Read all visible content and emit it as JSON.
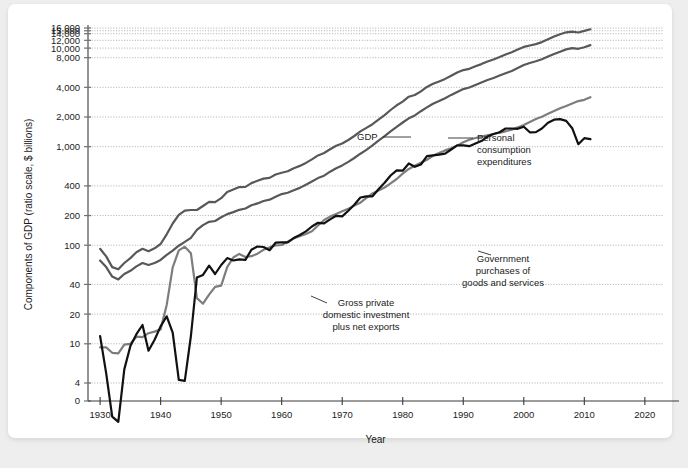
{
  "card": {
    "watermark": ""
  },
  "chart_data": {
    "type": "line",
    "title": "",
    "xlabel": "Year",
    "ylabel": "Components of GDP (ratio scale, $ billions)",
    "scale": "log",
    "grid": true,
    "legend_position": "inline-annotations",
    "xlim": [
      1928,
      2023
    ],
    "ylim": [
      3.2,
      17000
    ],
    "xticks": [
      1930,
      1940,
      1950,
      1960,
      1970,
      1980,
      1990,
      2000,
      2010,
      2020
    ],
    "xtick_labels": [
      "1930",
      "1940",
      "1950",
      "1960",
      "1970",
      "1980",
      "1990",
      "2000",
      "2010",
      "2020"
    ],
    "yticks": [
      0,
      4,
      10,
      20,
      40,
      100,
      200,
      400,
      1000,
      2000,
      4000,
      8000,
      10000,
      12000,
      14000,
      15000,
      16000
    ],
    "ytick_labels": [
      "0",
      "4",
      "10",
      "20",
      "40",
      "100",
      "200",
      "400",
      "1,000",
      "2,000",
      "4,000",
      "8,000",
      "10,000",
      "12,000",
      "14,000",
      "15,000",
      "16,000"
    ],
    "colors": {
      "gdp": "#585858",
      "pce": "#585858",
      "government": "#7d7d7d",
      "investment": "#111111"
    },
    "annotations": [
      {
        "id": "gdp",
        "text": "GDP",
        "x": 357,
        "y": 140,
        "anchor": "start",
        "leader": [
          [
            383,
            137
          ],
          [
            411,
            137
          ]
        ]
      },
      {
        "id": "pce",
        "lines": [
          "Personal",
          "consumption",
          "expenditures"
        ],
        "x": 477,
        "y": 141,
        "anchor": "start",
        "leader": [
          [
            448,
            138
          ],
          [
            473,
            138
          ]
        ]
      },
      {
        "id": "government",
        "lines": [
          "Government",
          "purchases of",
          "goods and services"
        ],
        "x": 503,
        "y": 262,
        "anchor": "middle",
        "leader": [
          [
            478,
            251
          ],
          [
            491,
            255
          ]
        ]
      },
      {
        "id": "investment",
        "lines": [
          "Gross private",
          "domestic investment",
          "plus net exports"
        ],
        "x": 366,
        "y": 306,
        "anchor": "middle",
        "leader": [
          [
            311,
            296
          ],
          [
            327,
            303
          ]
        ]
      }
    ],
    "series": [
      {
        "name": "GDP",
        "key": "gdp",
        "x": [
          1930,
          1931,
          1932,
          1933,
          1934,
          1935,
          1936,
          1937,
          1938,
          1939,
          1940,
          1941,
          1942,
          1943,
          1944,
          1945,
          1946,
          1947,
          1948,
          1949,
          1950,
          1951,
          1952,
          1953,
          1954,
          1955,
          1956,
          1957,
          1958,
          1959,
          1960,
          1961,
          1962,
          1963,
          1964,
          1965,
          1966,
          1967,
          1968,
          1969,
          1970,
          1971,
          1972,
          1973,
          1974,
          1975,
          1976,
          1977,
          1978,
          1979,
          1980,
          1981,
          1982,
          1983,
          1984,
          1985,
          1986,
          1987,
          1988,
          1989,
          1990,
          1991,
          1992,
          1993,
          1994,
          1995,
          1996,
          1997,
          1998,
          1999,
          2000,
          2001,
          2002,
          2003,
          2004,
          2005,
          2006,
          2007,
          2008,
          2009,
          2010,
          2011
        ],
        "values": [
          92,
          77,
          60,
          57,
          66,
          74,
          85,
          92,
          87,
          93,
          103,
          129,
          166,
          203,
          224,
          228,
          228,
          250,
          275,
          273,
          300,
          347,
          368,
          389,
          391,
          427,
          450,
          474,
          482,
          522,
          543,
          563,
          605,
          638,
          685,
          743,
          815,
          862,
          943,
          1020,
          1076,
          1168,
          1282,
          1429,
          1549,
          1689,
          1878,
          2086,
          2357,
          2632,
          2863,
          3211,
          3345,
          3638,
          4041,
          4347,
          4590,
          4870,
          5253,
          5658,
          5980,
          6174,
          6539,
          6879,
          7309,
          7664,
          8100,
          8609,
          9089,
          9661,
          10290,
          10625,
          10980,
          11512,
          12277,
          13095,
          13858,
          14480,
          14720,
          14418,
          14958,
          15534
        ]
      },
      {
        "name": "Personal consumption expenditures",
        "key": "pce",
        "x": [
          1930,
          1931,
          1932,
          1933,
          1934,
          1935,
          1936,
          1937,
          1938,
          1939,
          1940,
          1941,
          1942,
          1943,
          1944,
          1945,
          1946,
          1947,
          1948,
          1949,
          1950,
          1951,
          1952,
          1953,
          1954,
          1955,
          1956,
          1957,
          1958,
          1959,
          1960,
          1961,
          1962,
          1963,
          1964,
          1965,
          1966,
          1967,
          1968,
          1969,
          1970,
          1971,
          1972,
          1973,
          1974,
          1975,
          1976,
          1977,
          1978,
          1979,
          1980,
          1981,
          1982,
          1983,
          1984,
          1985,
          1986,
          1987,
          1988,
          1989,
          1990,
          1991,
          1992,
          1993,
          1994,
          1995,
          1996,
          1997,
          1998,
          1999,
          2000,
          2001,
          2002,
          2003,
          2004,
          2005,
          2006,
          2007,
          2008,
          2009,
          2010,
          2011
        ],
        "values": [
          70,
          60,
          48,
          45,
          51,
          55,
          61,
          66,
          63,
          66,
          71,
          80,
          88,
          99,
          108,
          119,
          143,
          160,
          173,
          176,
          192,
          207,
          217,
          229,
          236,
          254,
          266,
          281,
          290,
          310,
          330,
          341,
          362,
          382,
          411,
          443,
          480,
          507,
          557,
          603,
          646,
          700,
          767,
          848,
          927,
          1030,
          1149,
          1278,
          1428,
          1592,
          1757,
          1941,
          2077,
          2290,
          2503,
          2720,
          2899,
          3100,
          3353,
          3598,
          3839,
          3986,
          4235,
          4477,
          4743,
          4976,
          5257,
          5547,
          5879,
          6282,
          6739,
          7055,
          7351,
          7704,
          8196,
          8694,
          9207,
          9710,
          10001,
          9847,
          10202,
          10729
        ]
      },
      {
        "name": "Government purchases of goods and services",
        "key": "government",
        "x": [
          1930,
          1931,
          1932,
          1933,
          1934,
          1935,
          1936,
          1937,
          1938,
          1939,
          1940,
          1941,
          1942,
          1943,
          1944,
          1945,
          1946,
          1947,
          1948,
          1949,
          1950,
          1951,
          1952,
          1953,
          1954,
          1955,
          1956,
          1957,
          1958,
          1959,
          1960,
          1961,
          1962,
          1963,
          1964,
          1965,
          1966,
          1967,
          1968,
          1969,
          1970,
          1971,
          1972,
          1973,
          1974,
          1975,
          1976,
          1977,
          1978,
          1979,
          1980,
          1981,
          1982,
          1983,
          1984,
          1985,
          1986,
          1987,
          1988,
          1989,
          1990,
          1991,
          1992,
          1993,
          1994,
          1995,
          1996,
          1997,
          1998,
          1999,
          2000,
          2001,
          2002,
          2003,
          2004,
          2005,
          2006,
          2007,
          2008,
          2009,
          2010,
          2011
        ],
        "values": [
          9.2,
          9.2,
          8.1,
          8.0,
          9.8,
          10.0,
          11.8,
          11.7,
          12.8,
          13.3,
          14.0,
          24.8,
          59.6,
          88.6,
          96.5,
          83.0,
          29.1,
          25.5,
          31.5,
          37.8,
          38.8,
          59.8,
          75.1,
          81.6,
          76.0,
          77.3,
          82.0,
          89.9,
          95.0,
          99.8,
          100.6,
          108.4,
          118.2,
          123.8,
          130.0,
          138.4,
          158.6,
          180.2,
          195.1,
          208.0,
          221.4,
          234.3,
          252.1,
          269.9,
          302.6,
          335.0,
          358.0,
          385.0,
          424.0,
          470.0,
          533.0,
          595.0,
          639.0,
          687.0,
          738.0,
          808.0,
          862.0,
          916.0,
          962.0,
          1026.0,
          1110.0,
          1177.0,
          1225.0,
          1261.0,
          1304.0,
          1346.0,
          1388.0,
          1433.0,
          1487.0,
          1569.0,
          1665.0,
          1783.0,
          1903.0,
          2016.0,
          2153.0,
          2298.0,
          2449.0,
          2594.0,
          2740.0,
          2901.0,
          2990.0,
          3180.0
        ]
      },
      {
        "name": "Gross private domestic investment plus net exports",
        "key": "investment",
        "x": [
          1930,
          1931,
          1932,
          1933,
          1934,
          1935,
          1936,
          1937,
          1938,
          1939,
          1940,
          1941,
          1942,
          1943,
          1944,
          1945,
          1946,
          1947,
          1948,
          1949,
          1950,
          1951,
          1952,
          1953,
          1954,
          1955,
          1956,
          1957,
          1958,
          1959,
          1960,
          1961,
          1962,
          1963,
          1964,
          1965,
          1966,
          1967,
          1968,
          1969,
          1970,
          1971,
          1972,
          1973,
          1974,
          1975,
          1976,
          1977,
          1978,
          1979,
          1980,
          1981,
          1982,
          1983,
          1984,
          1985,
          1986,
          1987,
          1988,
          1989,
          1990,
          1991,
          1992,
          1993,
          1994,
          1995,
          1996,
          1997,
          1998,
          1999,
          2000,
          2001,
          2002,
          2003,
          2004,
          2005,
          2006,
          2007,
          2008,
          2009,
          2010,
          2011
        ],
        "values": [
          12.0,
          5.0,
          0.3,
          0.2,
          5.5,
          9.5,
          12.5,
          15.5,
          8.5,
          11.0,
          15.0,
          19.0,
          13.0,
          4.3,
          4.2,
          12.0,
          47.0,
          50.0,
          62.0,
          51.0,
          63.0,
          74.0,
          70.0,
          72.0,
          71.0,
          90.0,
          97.0,
          96.0,
          89.0,
          106.0,
          107.0,
          107.0,
          118.0,
          127.0,
          138.0,
          155.0,
          169.0,
          167.0,
          183.0,
          199.0,
          196.0,
          224.0,
          258.0,
          305.0,
          314.0,
          314.0,
          370.0,
          430.0,
          510.0,
          575.0,
          570.0,
          675.0,
          625.0,
          660.0,
          800.0,
          815.0,
          830.0,
          850.0,
          935.0,
          1030.0,
          1030.0,
          1010.0,
          1075.0,
          1140.0,
          1265.0,
          1345.0,
          1400.0,
          1530.0,
          1530.0,
          1520.0,
          1595.0,
          1400.0,
          1405.0,
          1530.0,
          1745.0,
          1880.0,
          1905.0,
          1825.0,
          1540.0,
          1060.0,
          1220.0,
          1190.0
        ]
      }
    ]
  }
}
